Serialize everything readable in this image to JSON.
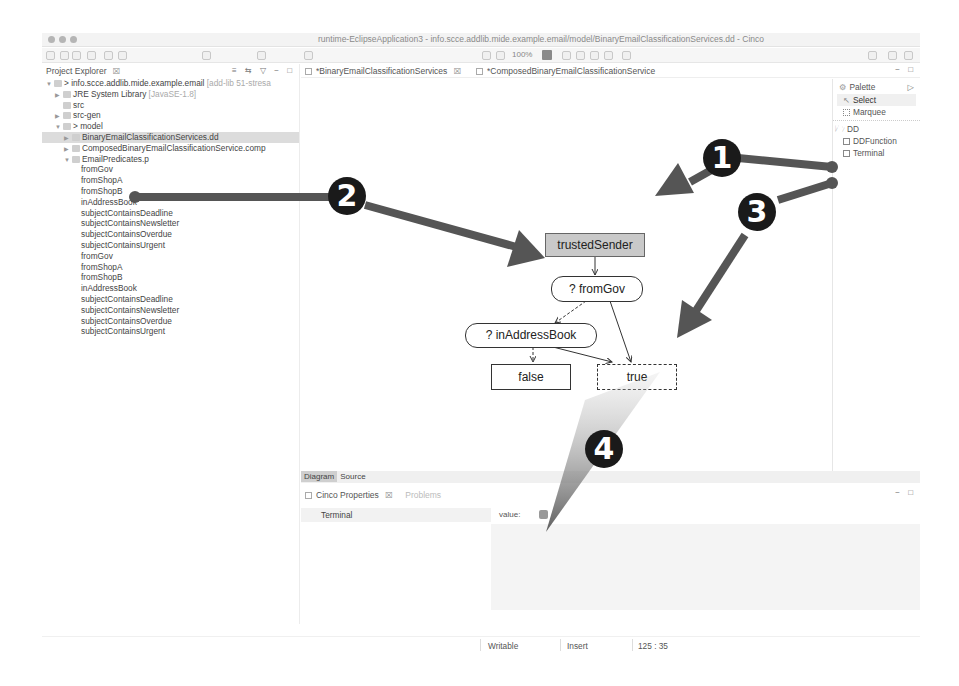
{
  "window": {
    "title": "runtime-EclipseApplication3 - info.scce.addlib.mide.example.email/model/BinaryEmailClassificationServices.dd - Cinco"
  },
  "toolbar": {
    "zoom_level": "100%"
  },
  "explorer": {
    "title": "Project Explorer",
    "close_glyph": "☒",
    "header_icons": "≡ ⇆ ▽ − □",
    "tree": [
      {
        "indent": 0,
        "twisty": "▼",
        "label": "> info.scce.addlib.mide.example.email",
        "decoration": " [add-lib 51-stresa",
        "selected": false
      },
      {
        "indent": 1,
        "twisty": "▶",
        "label": "JRE System Library",
        "decoration": " [JavaSE-1.8]",
        "selected": false
      },
      {
        "indent": 1,
        "twisty": "",
        "label": "src",
        "decoration": "",
        "selected": false
      },
      {
        "indent": 1,
        "twisty": "▶",
        "label": "src-gen",
        "decoration": "",
        "selected": false
      },
      {
        "indent": 1,
        "twisty": "▼",
        "label": "> model",
        "decoration": "",
        "selected": false
      },
      {
        "indent": 2,
        "twisty": "▶",
        "label": "BinaryEmailClassificationServices.dd",
        "decoration": "",
        "selected": true
      },
      {
        "indent": 2,
        "twisty": "▶",
        "label": "ComposedBinaryEmailClassificationService.comp",
        "decoration": "",
        "selected": false
      },
      {
        "indent": 2,
        "twisty": "▼",
        "label": "EmailPredicates.p",
        "decoration": "",
        "selected": false
      },
      {
        "indent": 3,
        "twisty": "",
        "label": "fromGov",
        "decoration": "",
        "selected": false
      },
      {
        "indent": 3,
        "twisty": "",
        "label": "fromShopA",
        "decoration": "",
        "selected": false
      },
      {
        "indent": 3,
        "twisty": "",
        "label": "fromShopB",
        "decoration": "",
        "selected": false
      },
      {
        "indent": 3,
        "twisty": "",
        "label": "inAddressBook",
        "decoration": "",
        "selected": false
      },
      {
        "indent": 3,
        "twisty": "",
        "label": "subjectContainsDeadline",
        "decoration": "",
        "selected": false
      },
      {
        "indent": 3,
        "twisty": "",
        "label": "subjectContainsNewsletter",
        "decoration": "",
        "selected": false
      },
      {
        "indent": 3,
        "twisty": "",
        "label": "subjectContainsOverdue",
        "decoration": "",
        "selected": false
      },
      {
        "indent": 3,
        "twisty": "",
        "label": "subjectContainsUrgent",
        "decoration": "",
        "selected": false
      },
      {
        "indent": 3,
        "twisty": "",
        "label": "fromGov",
        "decoration": "",
        "selected": false
      },
      {
        "indent": 3,
        "twisty": "",
        "label": "fromShopA",
        "decoration": "",
        "selected": false
      },
      {
        "indent": 3,
        "twisty": "",
        "label": "fromShopB",
        "decoration": "",
        "selected": false
      },
      {
        "indent": 3,
        "twisty": "",
        "label": "inAddressBook",
        "decoration": "",
        "selected": false
      },
      {
        "indent": 3,
        "twisty": "",
        "label": "subjectContainsDeadline",
        "decoration": "",
        "selected": false
      },
      {
        "indent": 3,
        "twisty": "",
        "label": "subjectContainsNewsletter",
        "decoration": "",
        "selected": false
      },
      {
        "indent": 3,
        "twisty": "",
        "label": "subjectContainsOverdue",
        "decoration": "",
        "selected": false
      },
      {
        "indent": 3,
        "twisty": "",
        "label": "subjectContainsUrgent",
        "decoration": "",
        "selected": false
      }
    ]
  },
  "editor": {
    "tabs": [
      {
        "label": "*BinaryEmailClassificationServices",
        "close_glyph": "☒",
        "active": true
      },
      {
        "label": "*ComposedBinaryEmailClassificationService",
        "close_glyph": "",
        "active": false
      }
    ],
    "window_controls": "− □",
    "bottom_tabs": [
      {
        "label": "Diagram",
        "active": true
      },
      {
        "label": "Source",
        "active": false
      }
    ]
  },
  "diagram": {
    "nodes": {
      "start": "trustedSender",
      "pred1": "? fromGov",
      "pred2": "? inAddressBook",
      "term_false": "false",
      "term_true": "true"
    }
  },
  "palette": {
    "title": "Palette",
    "collapse_glyph": "▷",
    "tools": [
      {
        "label": "Select"
      },
      {
        "label": "Marquee"
      }
    ],
    "group": "DD",
    "items": [
      {
        "label": "DDFunction"
      },
      {
        "label": "Terminal"
      }
    ]
  },
  "properties": {
    "title": "Cinco Properties",
    "close_glyph": "☒",
    "secondary_tab": "Problems",
    "window_controls": "− □",
    "selected_type": "Terminal",
    "field_label": "value:",
    "field_checked": true
  },
  "statusbar": {
    "mode": "Writable",
    "insert": "Insert",
    "position": "125 : 35"
  },
  "annotations": {
    "badges": [
      "1",
      "2",
      "3",
      "4"
    ],
    "arrow_color": "#555555",
    "badge_color": "#1a1a1a"
  }
}
